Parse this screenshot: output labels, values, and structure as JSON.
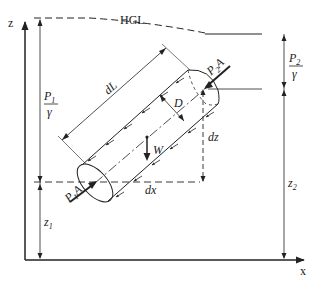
{
  "diagram": {
    "axes": {
      "z_label": "z",
      "x_label": "x"
    },
    "hgl_label": "HGL",
    "labels": {
      "p1_over_gamma_num": "P",
      "p1_sub": "1",
      "gamma": "γ",
      "p2_over_gamma_num": "P",
      "p2_sub": "2",
      "dL": "dL",
      "D": "D",
      "W": "W",
      "dz": "dz",
      "dx": "dx",
      "z1": "z",
      "z1_sub": "1",
      "z2": "z",
      "z2_sub": "2",
      "p1A": "P",
      "p1A_sub": "1",
      "p1A_A": "A",
      "p2A": "P",
      "p2A_sub": "2",
      "p2A_A": "A"
    },
    "colors": {
      "line": "#222222",
      "background": "#ffffff"
    }
  }
}
